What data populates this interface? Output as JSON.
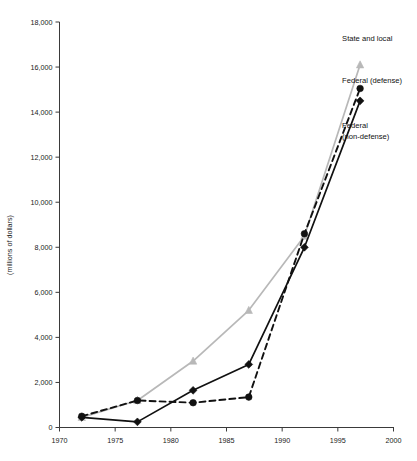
{
  "chart_data": {
    "type": "line",
    "title": "",
    "xlabel": "",
    "ylabel": "(millions of dollars)",
    "xlim": [
      1970,
      2000
    ],
    "ylim": [
      0,
      18000
    ],
    "xticks": [
      1970,
      1975,
      1980,
      1985,
      1990,
      1995,
      2000
    ],
    "xtick_labels": [
      "1970",
      "1975",
      "1980",
      "1985",
      "1990",
      "1995",
      "2000"
    ],
    "yticks": [
      0,
      2000,
      4000,
      6000,
      8000,
      10000,
      12000,
      14000,
      16000,
      18000
    ],
    "ytick_labels": [
      "0",
      "2,000",
      "4,000",
      "6,000",
      "8,000",
      "10,000",
      "12,000",
      "14,000",
      "16,000",
      "18,000"
    ],
    "grid": false,
    "legend_position": "inline-right-of-line-ends",
    "x": [
      1972,
      1977,
      1982,
      1987,
      1992,
      1997
    ],
    "series": [
      {
        "name": "State and local",
        "label": "State and local",
        "color": "#b8b8b8",
        "marker": "triangle",
        "linestyle": "solid",
        "values": [
          450,
          1200,
          2950,
          5200,
          8500,
          16100
        ],
        "label_x": 1997,
        "label_y": 17150
      },
      {
        "name": "Federal (defense)",
        "label": "Federal (defense)",
        "color": "#111111",
        "marker": "diamond",
        "linestyle": "solid",
        "values": [
          450,
          250,
          1650,
          2800,
          8000,
          14500
        ],
        "label_x": 1997,
        "label_y": 15300
      },
      {
        "name": "Federal (non-defense)",
        "label_line1": "Federal",
        "label_line2": "(non-defense)",
        "color": "#111111",
        "marker": "circle",
        "linestyle": "dashed",
        "values": [
          500,
          1200,
          1100,
          1350,
          8600,
          15050
        ],
        "label_x": 1997,
        "label_y": 13300
      }
    ]
  },
  "axis": {
    "y_axis_title": "(millions of dollars)"
  }
}
